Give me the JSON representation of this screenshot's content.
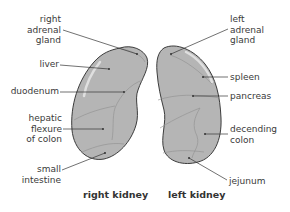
{
  "diagram": {
    "right_kidney": {
      "caption": "right kidney",
      "labels": [
        {
          "id": "right-adrenal-gland",
          "lines": [
            "right",
            "adrenal",
            "gland"
          ]
        },
        {
          "id": "liver",
          "lines": [
            "liver"
          ]
        },
        {
          "id": "duodenum",
          "lines": [
            "duodenum"
          ]
        },
        {
          "id": "hepatic-flexure",
          "lines": [
            "hepatic",
            "flexure",
            "of colon"
          ]
        },
        {
          "id": "small-intestine",
          "lines": [
            "small",
            "intestine"
          ]
        }
      ]
    },
    "left_kidney": {
      "caption": "left kidney",
      "labels": [
        {
          "id": "left-adrenal-gland",
          "lines": [
            "left",
            "adrenal",
            "gland"
          ]
        },
        {
          "id": "spleen",
          "lines": [
            "spleen"
          ]
        },
        {
          "id": "pancreas",
          "lines": [
            "pancreas"
          ]
        },
        {
          "id": "descending-colon",
          "lines": [
            "decending",
            "colon"
          ]
        },
        {
          "id": "jejunum",
          "lines": [
            "jejunum"
          ]
        }
      ]
    },
    "colors": {
      "kidney_fill": "#b5b5b5",
      "kidney_outline": "#3c3c3c",
      "region_line": "#8f8f8f",
      "leader_line": "#333333",
      "highlight": "#e6e6e6"
    }
  }
}
